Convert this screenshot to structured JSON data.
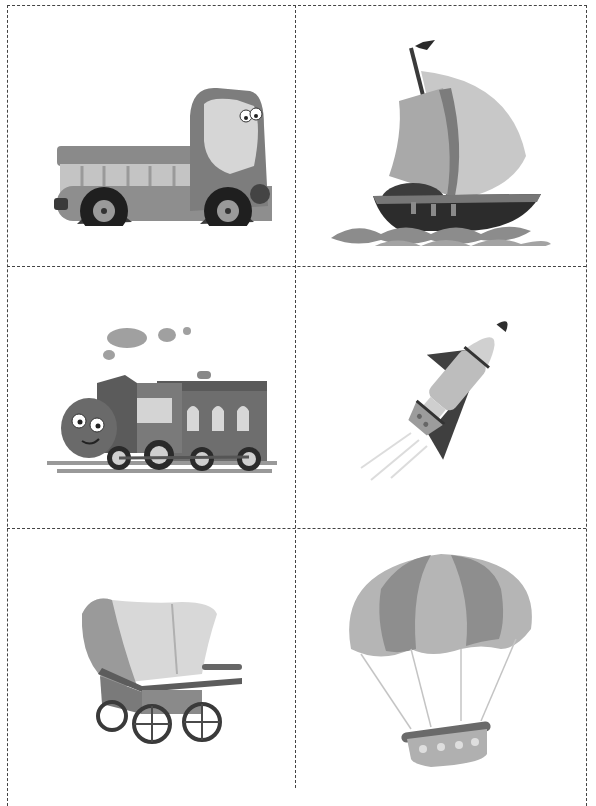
{
  "page": {
    "layout": {
      "columns": 2,
      "rows": 3,
      "border_style": "dashed",
      "border_color": "#444444"
    }
  },
  "cards": [
    {
      "id": "truck",
      "label": "Truck",
      "icon": "truck-icon"
    },
    {
      "id": "sailboat",
      "label": "Sailboat",
      "icon": "sailboat-icon"
    },
    {
      "id": "train",
      "label": "Steam train",
      "icon": "train-icon"
    },
    {
      "id": "rocket",
      "label": "Rocket",
      "icon": "rocket-icon"
    },
    {
      "id": "wagon",
      "label": "Covered wagon",
      "icon": "wagon-icon"
    },
    {
      "id": "balloon",
      "label": "Hot air balloon",
      "icon": "hot-air-balloon-icon"
    }
  ],
  "colors": {
    "dark": "#2e2e2e",
    "mid": "#7a7a7a",
    "light": "#b8b8b8",
    "pale": "#d9d9d9"
  }
}
